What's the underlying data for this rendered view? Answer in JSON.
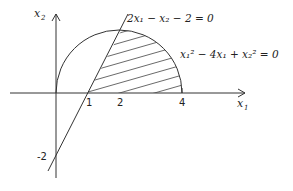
{
  "axes": {
    "x_label": "x",
    "x_sub": "1",
    "y_label": "x",
    "y_sub": "2"
  },
  "ticks": {
    "x": [
      "1",
      "2",
      "4"
    ],
    "y": [
      "-2"
    ]
  },
  "equations": {
    "line": "2x₁ − x₂ − 2 = 0",
    "circle": "x₁² − 4x₁ + x₂² = 0"
  },
  "colors": {
    "stroke": "#333333",
    "background": "#ffffff"
  }
}
